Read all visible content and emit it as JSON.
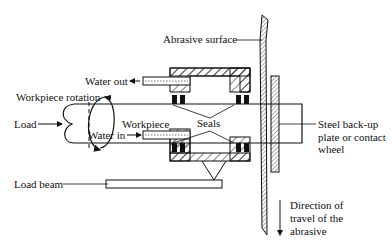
{
  "labels": {
    "abrasive_surface": "Abrasive surface",
    "water_out": "Water out",
    "workpiece_rotation": "Workpiece rotation",
    "load": "Load",
    "workpiece": "Workpiece",
    "seals": "Seals",
    "water_in": "Water in",
    "load_beam": "Load beam",
    "steel_backup_line1": "Steel back-up",
    "steel_backup_line2": "plate or contact",
    "steel_backup_line3": "wheel",
    "direction_line1": "Direction of",
    "direction_line2": "travel of the",
    "direction_line3": "abrasive"
  },
  "colors": {
    "ink": "#111111",
    "background": "#ffffff"
  }
}
